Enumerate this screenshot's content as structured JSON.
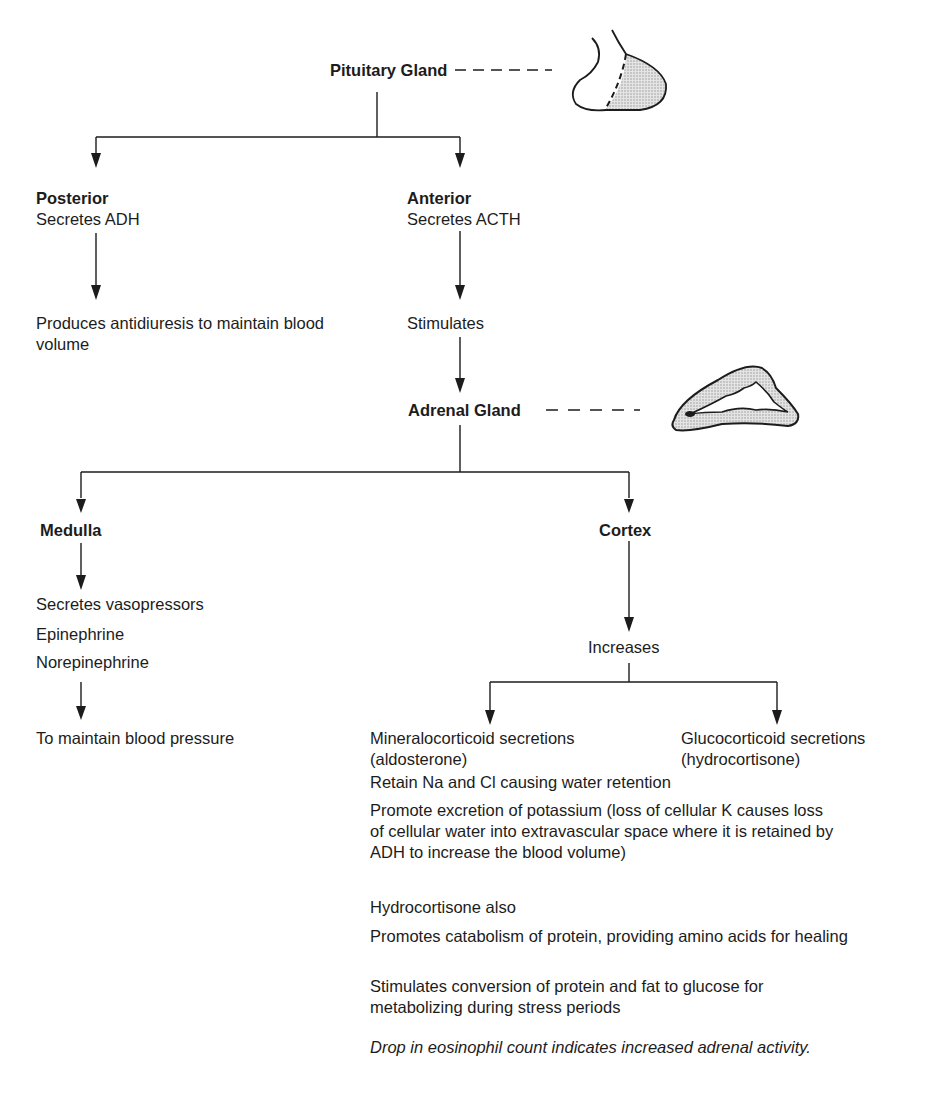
{
  "diagram": {
    "root": {
      "label": "Pituitary Gland",
      "icon": "pituitary-gland-illustration"
    },
    "pituitary_branches": {
      "posterior": {
        "title": "Posterior",
        "subtitle": "Secretes ADH",
        "effect": "Produces antidiuresis to maintain blood volume"
      },
      "anterior": {
        "title": "Anterior",
        "subtitle": "Secretes ACTH",
        "effect": "Stimulates"
      }
    },
    "adrenal": {
      "label": "Adrenal Gland",
      "icon": "adrenal-gland-illustration"
    },
    "adrenal_branches": {
      "medulla": {
        "title": "Medulla",
        "secretes": [
          "Secretes vasopressors",
          "Epinephrine",
          "Norepinephrine"
        ],
        "effect": "To maintain blood pressure"
      },
      "cortex": {
        "title": "Cortex",
        "action": "Increases",
        "outputs": [
          {
            "line1": "Mineralocorticoid secretions",
            "line2": "(aldosterone)"
          },
          {
            "line1": "Glucocorticoid secretions",
            "line2": "(hydrocortisone)"
          }
        ]
      }
    },
    "notes": {
      "mineralocorticoid": [
        "Retain Na and Cl causing water retention",
        "Promote excretion of potassium (loss of cellular K causes loss of cellular water into extravascular space where it is retained by ADH to increase the blood volume)"
      ],
      "hydrocortisone_heading": "Hydrocortisone also",
      "hydrocortisone": [
        "Promotes catabolism of protein, providing amino acids for healing",
        "Stimulates conversion of protein and fat to glucose for metabolizing during stress periods"
      ],
      "footnote": "Drop in eosinophil count indicates increased adrenal activity."
    }
  }
}
